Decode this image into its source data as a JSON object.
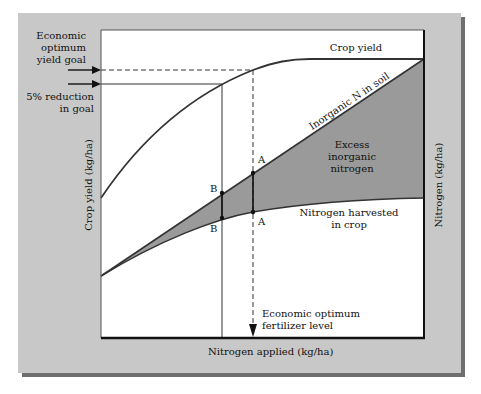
{
  "diagram": {
    "left_annotations": {
      "goal_line1": "Economic",
      "goal_line2": "optimum",
      "goal_line3": "yield goal",
      "reduction_line1": "5% reduction",
      "reduction_line2": "in goal"
    },
    "curve_labels": {
      "crop_yield": "Crop yield",
      "inorganic_n": "Inorganic N in soil",
      "excess_line1": "Excess",
      "excess_line2": "inorganic",
      "excess_line3": "nitrogen",
      "harvested_line1": "Nitrogen harvested",
      "harvested_line2": "in crop"
    },
    "points": {
      "a_upper": "A",
      "a_lower": "A",
      "b_upper": "B",
      "b_lower": "B"
    },
    "bottom_annotation": {
      "line1": "Economic optimum",
      "line2": "fertilizer level"
    },
    "axes": {
      "x_label": "Nitrogen applied (kg/ha)",
      "y_left_label": "Crop yield (kg/ha)",
      "y_right_label": "Nitrogen (kg/ha)"
    },
    "colors": {
      "panel": "#c8c8c8",
      "shadow": "#6e6e6e",
      "excess_fill": "#9a9a9a",
      "line": "#333333"
    }
  }
}
